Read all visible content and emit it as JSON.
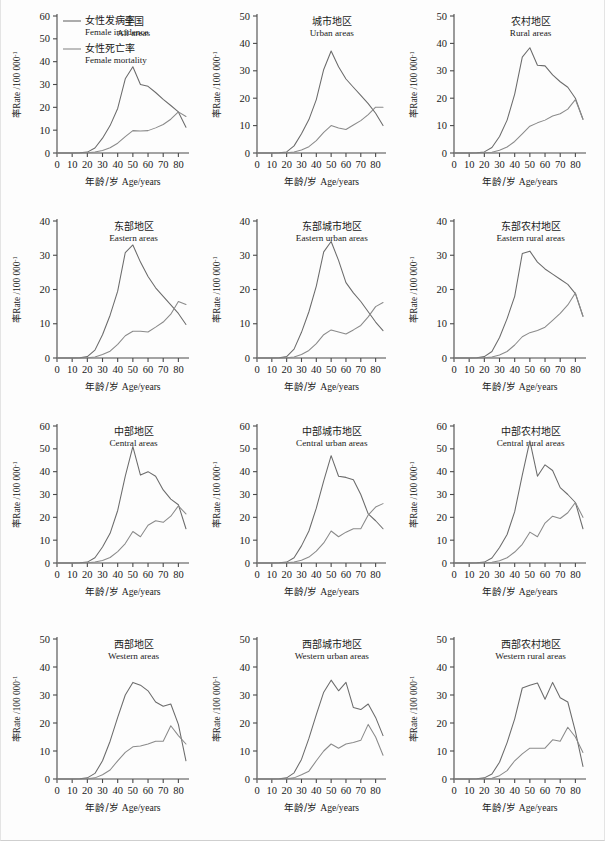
{
  "figure": {
    "axis_x_label_cn": "年龄/岁",
    "axis_x_label_en": "Age/years",
    "axis_y_label_cn": "率",
    "axis_y_label_en": "Rate /100 000",
    "axis_y_label_sup": "-1",
    "line_color_incidence": "#6b6b6b",
    "line_color_mortality": "#8a8a8a",
    "axis_color": "#4a4a4a"
  },
  "legend": {
    "items": [
      {
        "label_cn": "女性发病率",
        "label_en": "Female incidence",
        "key": "incidence"
      },
      {
        "label_cn": "女性死亡率",
        "label_en": "Female mortality",
        "key": "mortality"
      }
    ]
  },
  "chart_data": [
    {
      "type": "line",
      "panel_index": 0,
      "title_cn": "全国",
      "title_en": "All areas",
      "xlabel": "年龄/岁 Age/years",
      "ylabel": "率Rate /100 000-1",
      "xlim": [
        0,
        87
      ],
      "ylim": [
        0,
        60
      ],
      "xticks": [
        0,
        10,
        20,
        30,
        40,
        50,
        60,
        70,
        80
      ],
      "yticks": [
        0,
        10,
        20,
        30,
        40,
        50,
        60
      ],
      "x": [
        0,
        5,
        10,
        15,
        20,
        25,
        30,
        35,
        40,
        45,
        50,
        55,
        60,
        65,
        70,
        75,
        80,
        85
      ],
      "series": [
        {
          "name": "Female incidence",
          "values": [
            0,
            0,
            0,
            0.1,
            0.4,
            2.2,
            6.5,
            12.0,
            19.5,
            32.5,
            37.8,
            30.0,
            29.2,
            26.5,
            23.5,
            20.8,
            18.0,
            11.3
          ]
        },
        {
          "name": "Female mortality",
          "values": [
            0,
            0,
            0,
            0,
            0.1,
            0.4,
            1.1,
            2.3,
            4.3,
            7.2,
            9.8,
            9.6,
            9.8,
            11.0,
            12.5,
            14.8,
            18.0,
            16.0
          ]
        }
      ]
    },
    {
      "type": "line",
      "panel_index": 1,
      "title_cn": "城市地区",
      "title_en": "Urban areas",
      "xlabel": "年龄/岁 Age/years",
      "ylabel": "率Rate /100 000-1",
      "xlim": [
        0,
        87
      ],
      "ylim": [
        0,
        50
      ],
      "xticks": [
        0,
        10,
        20,
        30,
        40,
        50,
        60,
        70,
        80
      ],
      "yticks": [
        0,
        10,
        20,
        30,
        40,
        50
      ],
      "x": [
        0,
        5,
        10,
        15,
        20,
        25,
        30,
        35,
        40,
        45,
        50,
        55,
        60,
        65,
        70,
        75,
        80,
        85
      ],
      "series": [
        {
          "name": "Female incidence",
          "values": [
            0,
            0,
            0,
            0.1,
            0.4,
            2.6,
            7.0,
            12.2,
            19.5,
            30.5,
            37.2,
            31.5,
            27.0,
            24.0,
            21.0,
            18.0,
            14.5,
            10.0
          ]
        },
        {
          "name": "Female mortality",
          "values": [
            0,
            0,
            0,
            0,
            0.1,
            0.4,
            1.1,
            2.3,
            4.5,
            7.5,
            10.0,
            9.1,
            8.6,
            10.2,
            11.8,
            14.0,
            16.7,
            16.7
          ]
        }
      ]
    },
    {
      "type": "line",
      "panel_index": 2,
      "title_cn": "农村地区",
      "title_en": "Rural areas",
      "xlabel": "年龄/岁 Age/years",
      "ylabel": "率Rate /100 000-1",
      "xlim": [
        0,
        87
      ],
      "ylim": [
        0,
        50
      ],
      "xticks": [
        0,
        10,
        20,
        30,
        40,
        50,
        60,
        70,
        80
      ],
      "yticks": [
        0,
        10,
        20,
        30,
        40,
        50
      ],
      "x": [
        0,
        5,
        10,
        15,
        20,
        25,
        30,
        35,
        40,
        45,
        50,
        55,
        60,
        65,
        70,
        75,
        80,
        85
      ],
      "series": [
        {
          "name": "Female incidence",
          "values": [
            0,
            0,
            0,
            0.1,
            0.4,
            2.0,
            6.0,
            12.0,
            21.5,
            35.0,
            38.4,
            32.0,
            31.8,
            28.5,
            26.0,
            24.0,
            20.0,
            12.3
          ]
        },
        {
          "name": "Female mortality",
          "values": [
            0,
            0,
            0,
            0,
            0.1,
            0.3,
            1.0,
            2.2,
            4.2,
            7.0,
            9.8,
            11.0,
            12.0,
            13.5,
            14.3,
            16.0,
            19.5,
            12.3
          ]
        }
      ]
    },
    {
      "type": "line",
      "panel_index": 3,
      "title_cn": "东部地区",
      "title_en": "Eastern areas",
      "xlabel": "年龄/岁 Age/years",
      "ylabel": "率Rate /100 000-1",
      "xlim": [
        0,
        87
      ],
      "ylim": [
        0,
        40
      ],
      "xticks": [
        0,
        10,
        20,
        30,
        40,
        50,
        60,
        70,
        80
      ],
      "yticks": [
        0,
        10,
        20,
        30,
        40
      ],
      "x": [
        0,
        5,
        10,
        15,
        20,
        25,
        30,
        35,
        40,
        45,
        50,
        55,
        60,
        65,
        70,
        75,
        80,
        85
      ],
      "series": [
        {
          "name": "Female incidence",
          "values": [
            0,
            0,
            0,
            0.1,
            0.4,
            2.3,
            6.8,
            12.5,
            19.5,
            30.8,
            33.0,
            28.0,
            23.8,
            20.5,
            18.0,
            15.5,
            13.0,
            9.8
          ]
        },
        {
          "name": "Female mortality",
          "values": [
            0,
            0,
            0,
            0,
            0.1,
            0.3,
            1.0,
            2.0,
            4.0,
            6.5,
            7.8,
            7.8,
            7.6,
            9.0,
            10.5,
            12.8,
            16.5,
            15.6
          ]
        }
      ]
    },
    {
      "type": "line",
      "panel_index": 4,
      "title_cn": "东部城市地区",
      "title_en": "Eastern urban areas",
      "xlabel": "年龄/岁 Age/years",
      "ylabel": "率Rate /100 000-1",
      "xlim": [
        0,
        87
      ],
      "ylim": [
        0,
        40
      ],
      "xticks": [
        0,
        10,
        20,
        30,
        40,
        50,
        60,
        70,
        80
      ],
      "yticks": [
        0,
        10,
        20,
        30,
        40
      ],
      "x": [
        0,
        5,
        10,
        15,
        20,
        25,
        30,
        35,
        40,
        45,
        50,
        55,
        60,
        65,
        70,
        75,
        80,
        85
      ],
      "series": [
        {
          "name": "Female incidence",
          "values": [
            0,
            0,
            0,
            0.1,
            0.4,
            2.6,
            7.5,
            13.5,
            21.0,
            31.0,
            34.0,
            28.5,
            22.0,
            19.0,
            16.5,
            13.5,
            10.5,
            8.0
          ]
        },
        {
          "name": "Female mortality",
          "values": [
            0,
            0,
            0,
            0,
            0.1,
            0.3,
            1.0,
            2.2,
            4.2,
            6.8,
            8.2,
            7.6,
            7.0,
            8.2,
            9.5,
            12.0,
            15.0,
            16.2
          ]
        }
      ]
    },
    {
      "type": "line",
      "panel_index": 5,
      "title_cn": "东部农村地区",
      "title_en": "Eastern rural areas",
      "xlabel": "年龄/岁 Age/years",
      "ylabel": "率Rate /100 000-1",
      "xlim": [
        0,
        87
      ],
      "ylim": [
        0,
        40
      ],
      "xticks": [
        0,
        10,
        20,
        30,
        40,
        50,
        60,
        70,
        80
      ],
      "yticks": [
        0,
        10,
        20,
        30,
        40
      ],
      "x": [
        0,
        5,
        10,
        15,
        20,
        25,
        30,
        35,
        40,
        45,
        50,
        55,
        60,
        65,
        70,
        75,
        80,
        85
      ],
      "series": [
        {
          "name": "Female incidence",
          "values": [
            0,
            0,
            0,
            0.1,
            0.4,
            1.9,
            6.0,
            11.5,
            18.0,
            30.5,
            31.2,
            28.0,
            26.0,
            24.5,
            23.0,
            21.5,
            18.8,
            12.2
          ]
        },
        {
          "name": "Female mortality",
          "values": [
            0,
            0,
            0,
            0,
            0.1,
            0.3,
            0.9,
            1.9,
            3.8,
            6.2,
            7.4,
            8.0,
            9.0,
            11.0,
            13.0,
            15.5,
            19.0,
            12.2
          ]
        }
      ]
    },
    {
      "type": "line",
      "panel_index": 6,
      "title_cn": "中部地区",
      "title_en": "Central areas",
      "xlabel": "年龄/岁 Age/years",
      "ylabel": "率Rate /100 000-1",
      "xlim": [
        0,
        87
      ],
      "ylim": [
        0,
        60
      ],
      "xticks": [
        0,
        10,
        20,
        30,
        40,
        50,
        60,
        70,
        80
      ],
      "yticks": [
        0,
        10,
        20,
        30,
        40,
        50,
        60
      ],
      "x": [
        0,
        5,
        10,
        15,
        20,
        25,
        30,
        35,
        40,
        45,
        50,
        55,
        60,
        65,
        70,
        75,
        80,
        85
      ],
      "series": [
        {
          "name": "Female incidence",
          "values": [
            0,
            0,
            0,
            0.1,
            0.4,
            2.3,
            7.0,
            13.0,
            23.0,
            38.0,
            51.0,
            38.5,
            40.0,
            38.0,
            32.0,
            28.0,
            25.5,
            15.0
          ]
        },
        {
          "name": "Female mortality",
          "values": [
            0,
            0,
            0,
            0,
            0.1,
            0.4,
            1.1,
            2.4,
            5.0,
            8.5,
            13.8,
            11.5,
            16.5,
            18.5,
            17.8,
            20.5,
            25.0,
            21.5
          ]
        }
      ]
    },
    {
      "type": "line",
      "panel_index": 7,
      "title_cn": "中部城市地区",
      "title_en": "Central urban areas",
      "xlabel": "年龄/岁 Age/years",
      "ylabel": "率Rate /100 000-1",
      "xlim": [
        0,
        87
      ],
      "ylim": [
        0,
        60
      ],
      "xticks": [
        0,
        10,
        20,
        30,
        40,
        50,
        60,
        70,
        80
      ],
      "yticks": [
        0,
        10,
        20,
        30,
        40,
        50,
        60
      ],
      "x": [
        0,
        5,
        10,
        15,
        20,
        25,
        30,
        35,
        40,
        45,
        50,
        55,
        60,
        65,
        70,
        75,
        80,
        85
      ],
      "series": [
        {
          "name": "Female incidence",
          "values": [
            0,
            0,
            0,
            0.1,
            0.4,
            2.3,
            7.5,
            14.0,
            24.0,
            36.0,
            47.0,
            38.0,
            37.5,
            36.5,
            30.0,
            21.5,
            18.5,
            15.0
          ]
        },
        {
          "name": "Female mortality",
          "values": [
            0,
            0,
            0,
            0,
            0.1,
            0.4,
            1.2,
            2.6,
            5.2,
            8.8,
            14.0,
            11.5,
            13.5,
            15.0,
            15.0,
            21.0,
            24.5,
            26.0
          ]
        }
      ]
    },
    {
      "type": "line",
      "panel_index": 8,
      "title_cn": "中部农村地区",
      "title_en": "Central rural areas",
      "xlabel": "年龄/岁 Age/years",
      "ylabel": "率Rate /100 000-1",
      "xlim": [
        0,
        87
      ],
      "ylim": [
        0,
        60
      ],
      "xticks": [
        0,
        10,
        20,
        30,
        40,
        50,
        60,
        70,
        80
      ],
      "yticks": [
        0,
        10,
        20,
        30,
        40,
        50,
        60
      ],
      "x": [
        0,
        5,
        10,
        15,
        20,
        25,
        30,
        35,
        40,
        45,
        50,
        55,
        60,
        65,
        70,
        75,
        80,
        85
      ],
      "series": [
        {
          "name": "Female incidence",
          "values": [
            0,
            0,
            0,
            0.1,
            0.4,
            2.2,
            6.8,
            12.5,
            22.5,
            38.5,
            53.5,
            38.0,
            43.0,
            40.5,
            33.0,
            30.0,
            26.5,
            15.0
          ]
        },
        {
          "name": "Female mortality",
          "values": [
            0,
            0,
            0,
            0,
            0.1,
            0.3,
            1.0,
            2.3,
            4.8,
            8.2,
            13.5,
            11.5,
            17.5,
            20.5,
            19.5,
            22.0,
            26.5,
            20.0
          ]
        }
      ]
    },
    {
      "type": "line",
      "panel_index": 9,
      "title_cn": "西部地区",
      "title_en": "Western areas",
      "xlabel": "年龄/岁 Age/years",
      "ylabel": "率Rate /100 000-1",
      "xlim": [
        0,
        87
      ],
      "ylim": [
        0,
        50
      ],
      "xticks": [
        0,
        10,
        20,
        30,
        40,
        50,
        60,
        70,
        80
      ],
      "yticks": [
        0,
        10,
        20,
        30,
        40,
        50
      ],
      "x": [
        0,
        5,
        10,
        15,
        20,
        25,
        30,
        35,
        40,
        45,
        50,
        55,
        60,
        65,
        70,
        75,
        80,
        85
      ],
      "series": [
        {
          "name": "Female incidence",
          "values": [
            0,
            0,
            0,
            0.1,
            0.4,
            2.0,
            6.5,
            13.5,
            22.0,
            30.0,
            34.5,
            33.5,
            31.5,
            27.5,
            26.0,
            26.8,
            19.5,
            6.5
          ]
        },
        {
          "name": "Female mortality",
          "values": [
            0,
            0,
            0,
            0,
            0.1,
            0.4,
            1.5,
            3.2,
            6.5,
            9.5,
            11.5,
            11.8,
            12.5,
            13.5,
            13.5,
            19.0,
            15.5,
            12.5
          ]
        }
      ]
    },
    {
      "type": "line",
      "panel_index": 10,
      "title_cn": "西部城市地区",
      "title_en": "Western urban areas",
      "xlabel": "年龄/岁 Age/years",
      "ylabel": "率Rate /100 000-1",
      "xlim": [
        0,
        87
      ],
      "ylim": [
        0,
        50
      ],
      "xticks": [
        0,
        10,
        20,
        30,
        40,
        50,
        60,
        70,
        80
      ],
      "yticks": [
        0,
        10,
        20,
        30,
        40,
        50
      ],
      "x": [
        0,
        5,
        10,
        15,
        20,
        25,
        30,
        35,
        40,
        45,
        50,
        55,
        60,
        65,
        70,
        75,
        80,
        85
      ],
      "series": [
        {
          "name": "Female incidence",
          "values": [
            0,
            0,
            0,
            0.1,
            0.4,
            2.2,
            7.0,
            14.5,
            23.0,
            31.0,
            35.3,
            31.5,
            34.5,
            25.5,
            24.8,
            26.8,
            22.0,
            15.5
          ]
        },
        {
          "name": "Female mortality",
          "values": [
            0,
            0,
            0,
            0,
            0.1,
            0.4,
            1.5,
            2.8,
            6.5,
            10.0,
            12.5,
            11.0,
            12.5,
            13.0,
            13.8,
            19.5,
            15.0,
            8.5
          ]
        }
      ]
    },
    {
      "type": "line",
      "panel_index": 11,
      "title_cn": "西部农村地区",
      "title_en": "Western rural areas",
      "xlabel": "年龄/岁 Age/years",
      "ylabel": "率Rate /100 000-1",
      "xlim": [
        0,
        87
      ],
      "ylim": [
        0,
        50
      ],
      "xticks": [
        0,
        10,
        20,
        30,
        40,
        50,
        60,
        70,
        80
      ],
      "yticks": [
        0,
        10,
        20,
        30,
        40,
        50
      ],
      "x": [
        0,
        5,
        10,
        15,
        20,
        25,
        30,
        35,
        40,
        45,
        50,
        55,
        60,
        65,
        70,
        75,
        80,
        85
      ],
      "series": [
        {
          "name": "Female incidence",
          "values": [
            0,
            0,
            0,
            0.1,
            0.4,
            1.8,
            6.0,
            13.0,
            21.5,
            32.5,
            33.5,
            34.3,
            28.5,
            34.5,
            29.0,
            27.5,
            17.0,
            4.5
          ]
        },
        {
          "name": "Female mortality",
          "values": [
            0,
            0,
            0,
            0,
            0.1,
            0.3,
            1.2,
            3.0,
            6.5,
            9.0,
            11.0,
            11.0,
            11.0,
            14.0,
            13.5,
            18.5,
            15.0,
            9.5
          ]
        }
      ]
    }
  ]
}
